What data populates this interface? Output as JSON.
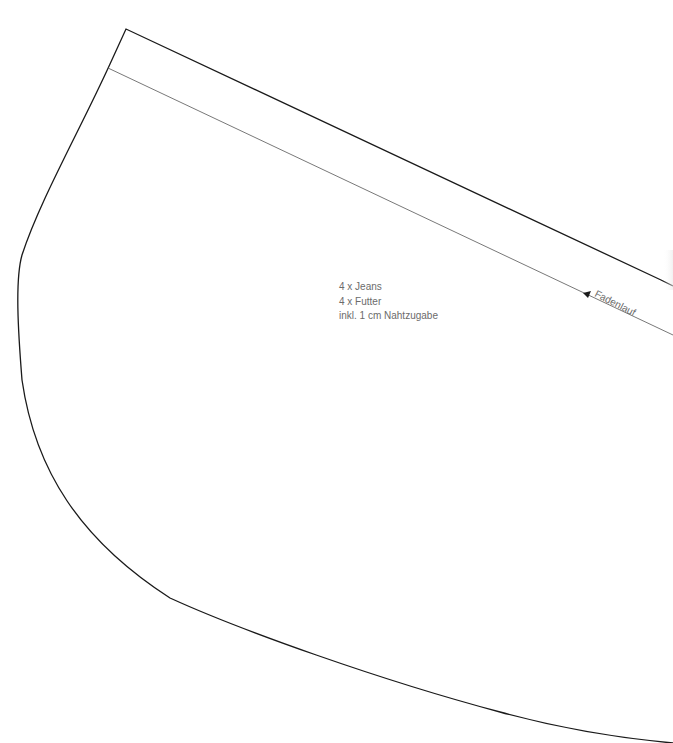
{
  "pattern": {
    "cut_instructions": [
      "4 x Jeans",
      "4 x Futter",
      "inkl. 1 cm Nahtzugabe"
    ],
    "grainline_label": "Fadenlauf"
  },
  "colors": {
    "outline": "#1a1a1a",
    "inner_line": "#555555",
    "text": "#6b6b6b"
  }
}
